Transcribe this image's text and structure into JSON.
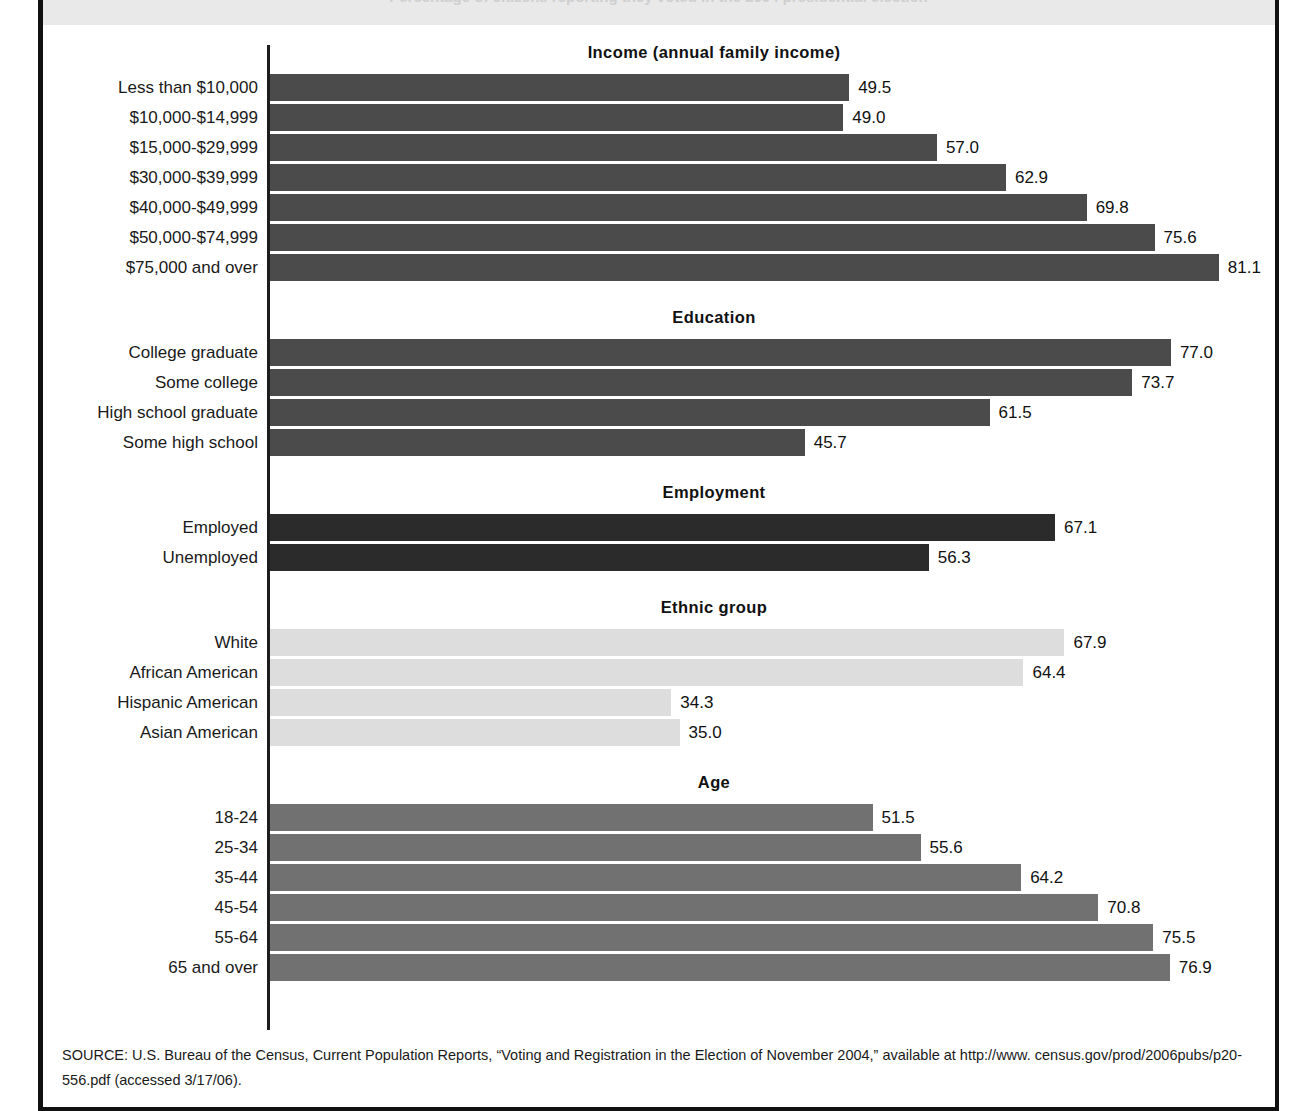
{
  "page": {
    "header_band_text": "Percentage of citizens reporting they voted in the 2004 presidential election",
    "source_note": "SOURCE: U.S. Bureau of the Census, Current Population Reports, “Voting and Registration in the Election of November 2004,” available at http://www. census.gov/prod/2006pubs/p20-556.pdf (accessed 3/17/06)."
  },
  "chart_data": {
    "type": "bar",
    "orientation": "horizontal",
    "title": "",
    "xlabel": "",
    "ylabel": "",
    "xlim": [
      0,
      100
    ],
    "grid": false,
    "legend": false,
    "value_labels": true,
    "axis_line_color": "#1d1d1d",
    "groups": [
      {
        "title": "Income (annual family income)",
        "color": "#4b4b4b",
        "categories": [
          "Less than $10,000",
          "$10,000-$14,999",
          "$15,000-$29,999",
          "$30,000-$39,999",
          "$40,000-$49,999",
          "$50,000-$74,999",
          "$75,000 and over"
        ],
        "values": [
          49.5,
          49.0,
          57.0,
          62.9,
          69.8,
          75.6,
          81.1
        ],
        "labels": [
          "49.5",
          "49.0",
          "57.0",
          "62.9",
          "69.8",
          "75.6",
          "81.1"
        ]
      },
      {
        "title": "Education",
        "color": "#4b4b4b",
        "categories": [
          "College graduate",
          "Some college",
          "High school graduate",
          "Some high school"
        ],
        "values": [
          77.0,
          73.7,
          61.5,
          45.7
        ],
        "labels": [
          "77.0",
          "73.7",
          "61.5",
          "45.7"
        ]
      },
      {
        "title": "Employment",
        "color": "#2b2b2b",
        "categories": [
          "Employed",
          "Unemployed"
        ],
        "values": [
          67.1,
          56.3
        ],
        "labels": [
          "67.1",
          "56.3"
        ]
      },
      {
        "title": "Ethnic group",
        "color": "#dddddd",
        "categories": [
          "White",
          "African American",
          "Hispanic American",
          "Asian American"
        ],
        "values": [
          67.9,
          64.4,
          34.3,
          35.0
        ],
        "labels": [
          "67.9",
          "64.4",
          "34.3",
          "35.0"
        ]
      },
      {
        "title": "Age",
        "color": "#717171",
        "categories": [
          "18-24",
          "25-34",
          "35-44",
          "45-54",
          "55-64",
          "65 and over"
        ],
        "values": [
          51.5,
          55.6,
          64.2,
          70.8,
          75.5,
          76.9
        ],
        "labels": [
          "51.5",
          "55.6",
          "64.2",
          "70.8",
          "75.5",
          "76.9"
        ]
      }
    ]
  }
}
